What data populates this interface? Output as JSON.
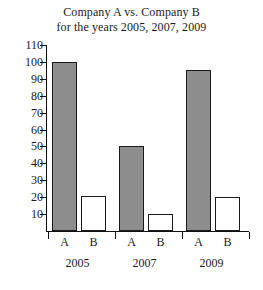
{
  "chart_data": {
    "type": "bar",
    "title": "Company A vs. Company B for the years 2005, 2007, 2009",
    "title_lines": [
      "Company A vs. Company B",
      "for the years 2005, 2007, 2009"
    ],
    "xlabel": "",
    "ylabel": "",
    "ylim": [
      0,
      110
    ],
    "ytick_values": [
      10,
      20,
      30,
      40,
      50,
      60,
      70,
      80,
      90,
      100,
      110
    ],
    "ytick_labels": [
      "10",
      "20",
      "30",
      "40",
      "50",
      "60",
      "70",
      "80",
      "90",
      "100",
      "110"
    ],
    "grid": false,
    "legend": "none",
    "categories": [
      "2005",
      "2007",
      "2009"
    ],
    "series": [
      {
        "name": "A",
        "label": "A",
        "color": "#8d8d8d",
        "values": [
          100,
          50,
          95
        ]
      },
      {
        "name": "B",
        "label": "B",
        "color": "#ffffff",
        "values": [
          21,
          10,
          20
        ]
      }
    ],
    "bars": [
      {
        "group": "2005",
        "series": "A",
        "label": "A",
        "value": 100
      },
      {
        "group": "2005",
        "series": "B",
        "label": "B",
        "value": 21
      },
      {
        "group": "2007",
        "series": "A",
        "label": "A",
        "value": 50
      },
      {
        "group": "2007",
        "series": "B",
        "label": "B",
        "value": 10
      },
      {
        "group": "2009",
        "series": "A",
        "label": "A",
        "value": 95
      },
      {
        "group": "2009",
        "series": "B",
        "label": "B",
        "value": 20
      }
    ]
  },
  "style": {
    "bar_fill_a": "#8d8d8d",
    "bar_fill_b": "#ffffff",
    "bar_edge": "#1a1a1a",
    "axis_color": "#111111",
    "background": "#ffffff",
    "text_color": "#1a1a1a"
  }
}
